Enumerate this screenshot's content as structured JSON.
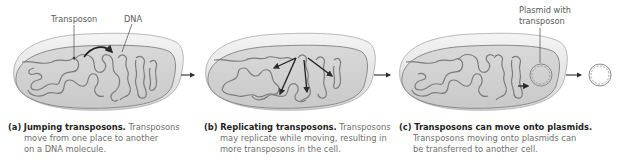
{
  "figure": {
    "panels": [
      {
        "id": "a",
        "label": "(a)",
        "title": "Jumping transposons.",
        "text_line1": "Transposons",
        "text_line2": "move from one place to another",
        "text_line3": "on a DNA molecule.",
        "callouts": [
          "Transposon",
          "DNA"
        ]
      },
      {
        "id": "b",
        "label": "(b)",
        "title": "Replicating transposons.",
        "text_line1": "Transposons",
        "text_line2": "may replicate while moving, resulting in",
        "text_line3": "more transposons in the cell."
      },
      {
        "id": "c",
        "label": "(c)",
        "title": "Transposons can move onto plasmids.",
        "text_line2": "Transposons moving onto plasmids can",
        "text_line3": "be transferred to another cell.",
        "callouts": [
          "Plasmid with",
          "transposon"
        ]
      }
    ],
    "colors": {
      "cell_fill": "#d4d4d4",
      "cell_rim": "#ececec",
      "cell_outline": "#8a8a8a",
      "dna_strand": "#7c7c7c",
      "arrow": "#2b2b2b",
      "caption_bold": "#1f1f1f",
      "caption_text": "#6e6e6e"
    }
  }
}
